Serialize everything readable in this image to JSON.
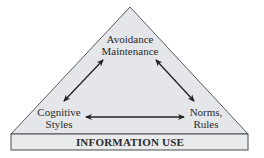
{
  "diagram": {
    "nodes": {
      "top": {
        "line1": "Avoidance",
        "line2": "Maintenance"
      },
      "left": {
        "line1": "Cognitive",
        "line2": "Styles"
      },
      "right": {
        "line1": "Norms,",
        "line2": "Rules"
      }
    },
    "base_label": "INFORMATION USE",
    "edges": [
      {
        "from": "top",
        "to": "left",
        "type": "bidirectional"
      },
      {
        "from": "top",
        "to": "right",
        "type": "bidirectional"
      },
      {
        "from": "left",
        "to": "right",
        "type": "bidirectional"
      }
    ],
    "colors": {
      "fill": "#e4e6e9",
      "stroke": "#4a4a4a",
      "arrow": "#222222",
      "text": "#2a2a2a"
    }
  }
}
